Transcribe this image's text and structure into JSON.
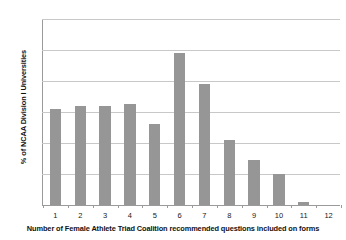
{
  "chart_data": {
    "type": "bar",
    "title": "",
    "xlabel": "Number of Female Athlete Triad Coalition recommended questions included on forms",
    "ylabel": "% of NCAA Division I Universities",
    "categories": [
      "1",
      "2",
      "3",
      "4",
      "5",
      "6",
      "7",
      "8",
      "9",
      "10",
      "11",
      "12"
    ],
    "values": [
      31,
      32,
      32,
      32.5,
      26,
      49,
      39,
      21,
      14.5,
      10,
      1,
      0
    ],
    "series": [
      {
        "name": "% of NCAA Division I Universities",
        "values": [
          31,
          32,
          32,
          32.5,
          26,
          49,
          39,
          21,
          14.5,
          10,
          1,
          0
        ]
      }
    ],
    "ylim": [
      0,
      60
    ],
    "yticks": [
      0,
      10,
      20,
      30,
      40,
      50,
      60
    ],
    "ytick_labels": [
      "0",
      "10",
      "20",
      "30",
      "40",
      "50",
      "60"
    ],
    "grid": "horizontal",
    "legend": "none",
    "bar_color": "#969696",
    "gridline_color": "#c8c8c8",
    "axis_color": "#9a9a9a",
    "background": "#ffffff"
  }
}
